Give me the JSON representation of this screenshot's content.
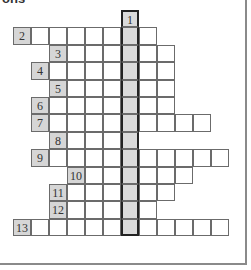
{
  "header": {
    "partial_text": "ons"
  },
  "colors": {
    "number_cell": "#d6d6d6",
    "key_column": "#dadada",
    "grid_line": "#6b6b6b",
    "frame": "#8a8a8a"
  },
  "grid": {
    "origin_x": 13,
    "origin_y": 10,
    "cell_w": 18,
    "cell_h": 17.4,
    "key_column": 6,
    "rows": [
      {
        "number": "1",
        "label_col": 6,
        "start": 6,
        "end": 6
      },
      {
        "number": "2",
        "label_col": 0,
        "start": 0,
        "end": 7
      },
      {
        "number": "3",
        "label_col": 2,
        "start": 2,
        "end": 8
      },
      {
        "number": "4",
        "label_col": 1,
        "start": 1,
        "end": 8
      },
      {
        "number": "5",
        "label_col": 2,
        "start": 2,
        "end": 8
      },
      {
        "number": "6",
        "label_col": 1,
        "start": 1,
        "end": 8
      },
      {
        "number": "7",
        "label_col": 1,
        "start": 1,
        "end": 10
      },
      {
        "number": "8",
        "label_col": 2,
        "start": 2,
        "end": 6
      },
      {
        "number": "9",
        "label_col": 1,
        "start": 1,
        "end": 11
      },
      {
        "number": "10",
        "label_col": 3,
        "start": 3,
        "end": 9
      },
      {
        "number": "11",
        "label_col": 2,
        "start": 2,
        "end": 8
      },
      {
        "number": "12",
        "label_col": 2,
        "start": 2,
        "end": 7
      },
      {
        "number": "13",
        "label_col": 0,
        "start": 0,
        "end": 11
      }
    ]
  }
}
